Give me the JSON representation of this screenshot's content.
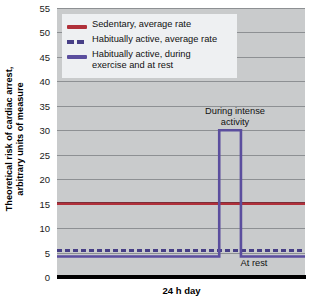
{
  "chart_data": {
    "type": "line",
    "title": "",
    "xlabel": "24 h day",
    "ylabel_line1": "Theoretical risk of cardiac arrest,",
    "ylabel_line2": "arbitrary units of measure",
    "ylim": [
      0,
      55
    ],
    "yticks": [
      0,
      5,
      10,
      15,
      20,
      25,
      30,
      35,
      40,
      45,
      50,
      55
    ],
    "ytick_labels": [
      "0",
      "5",
      "10",
      "15",
      "20",
      "25",
      "30",
      "35",
      "40",
      "45",
      "50",
      "55"
    ],
    "xlim": [
      0,
      24
    ],
    "xticks": [],
    "xtick_labels": [],
    "grid": true,
    "grid_axis": "y",
    "legend_position": "upper-left",
    "plot_background": "#c9cbcc",
    "series": [
      {
        "name": "Sedentary, average rate",
        "style": "solid",
        "color": "#b0303a",
        "constant_value": 15,
        "x": [
          0,
          24
        ],
        "values": [
          15,
          15
        ]
      },
      {
        "name": "Habitually active, average rate",
        "style": "dashed",
        "color": "#473f86",
        "constant_value": 5.5,
        "x": [
          0,
          24
        ],
        "values": [
          5.5,
          5.5
        ]
      },
      {
        "name": "Habitually active, during exercise and at rest",
        "style": "solid-step",
        "color": "#5b4e9e",
        "x": [
          0,
          15.7,
          15.7,
          17.8,
          17.8,
          24
        ],
        "values": [
          4.2,
          4.2,
          30,
          30,
          4.2,
          4.2
        ],
        "rest_value": 4.2,
        "exercise_peak_value": 30
      }
    ],
    "annotations": [
      {
        "text_line1": "During intense",
        "text_line2": "activity",
        "x": 16.7,
        "y": 34
      },
      {
        "text_line1": "At rest",
        "text_line2": "",
        "x": 19.6,
        "y": 2.5
      }
    ]
  },
  "legend": {
    "items": [
      {
        "label": "Sedentary, average rate",
        "label_line2": "",
        "swatch": "solid-red"
      },
      {
        "label": "Habitually active, average rate",
        "label_line2": "",
        "swatch": "dashed-purple"
      },
      {
        "label": "Habitually active, during",
        "label_line2": "exercise and at rest",
        "swatch": "solid-purple"
      }
    ]
  },
  "colors": {
    "sedentary": "#b0303a",
    "active_average": "#473f86",
    "active_exercise": "#5b4e9e",
    "plot_bg": "#c9cbcc",
    "gridline": "#8d9093",
    "axis": "#000000"
  }
}
